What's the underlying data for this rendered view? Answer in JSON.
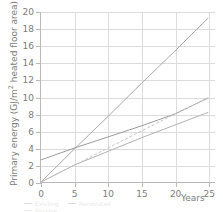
{
  "chart_data": {
    "type": "line",
    "title": "",
    "xlabel": "Years",
    "ylabel": "Primary energy (GJ/m² heated floor area)",
    "xlim": [
      0,
      26
    ],
    "ylim": [
      0,
      20
    ],
    "xticks": [
      0,
      5,
      10,
      15,
      20,
      25
    ],
    "yticks": [
      0,
      2,
      4,
      6,
      8,
      10,
      12,
      14,
      16,
      18,
      20
    ],
    "grid": true,
    "legend_position": "bottom-left-clipped",
    "x": [
      0,
      5,
      10,
      15,
      20,
      25
    ],
    "series": [
      {
        "name": "Existing building",
        "color": "#a8a8a8",
        "style": "solid",
        "values": [
          0.0,
          3.9,
          7.7,
          11.6,
          15.4,
          19.3
        ]
      },
      {
        "name": "Renovated building",
        "color": "#9a9a9a",
        "style": "solid",
        "values": [
          2.6,
          4.0,
          5.3,
          6.6,
          8.0,
          9.9
        ]
      },
      {
        "name": "Passive house renovation",
        "color": "#b0b0b0",
        "style": "solid",
        "values": [
          0.0,
          2.0,
          3.6,
          5.2,
          6.7,
          8.2
        ]
      },
      {
        "name": "New passive house",
        "color": "#c4c4c4",
        "style": "dashed",
        "values": [
          0.0,
          2.0,
          4.0,
          6.0,
          8.0,
          9.9
        ]
      }
    ]
  },
  "axes": {
    "x_tick_labels": [
      "0",
      "5",
      "10",
      "15",
      "20",
      "25"
    ],
    "y_tick_labels": [
      "0",
      "2",
      "4",
      "6",
      "8",
      "10",
      "12",
      "14",
      "16",
      "18",
      "20"
    ],
    "x_axis_title": "Years",
    "y_axis_title_prefix": "Primary energy (GJ/m",
    "y_axis_title_sup": "2",
    "y_axis_title_suffix": " heated floor area)"
  },
  "legend": {
    "items": [
      {
        "label": "Existing",
        "color": "#a8a8a8"
      },
      {
        "label": "Renovated",
        "color": "#9a9a9a"
      },
      {
        "label": "Passive",
        "color": "#c4c4c4"
      }
    ]
  },
  "colors": {
    "grid": "#dcdcdc",
    "axis": "#b9b9b9",
    "text": "#7d7d7d",
    "background": "#ffffff"
  }
}
